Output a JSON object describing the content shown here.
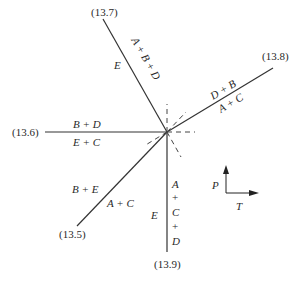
{
  "diagram": {
    "type": "phase-diagram-invariant-point",
    "axes": {
      "vertical": "P",
      "horizontal": "T"
    },
    "invariant_point": {
      "x": 167,
      "y": 132
    },
    "reactions": [
      {
        "id": "13.7",
        "label": "(13.7)",
        "side_a": "A + B + D",
        "side_b": "E"
      },
      {
        "id": "13.8",
        "label": "(13.8)",
        "side_a": "D + B",
        "side_b": "A + C"
      },
      {
        "id": "13.6",
        "label": "(13.6)",
        "side_a": "B + D",
        "side_b": "E + C"
      },
      {
        "id": "13.5",
        "label": "(13.5)",
        "side_a": "B + E",
        "side_b": "A + C"
      },
      {
        "id": "13.9",
        "label": "(13.9)",
        "side_a": "A + C + D",
        "side_b": "E"
      }
    ],
    "vertical_stack": {
      "a": "A",
      "p1": "+",
      "c": "C",
      "p2": "+",
      "d": "D"
    }
  }
}
